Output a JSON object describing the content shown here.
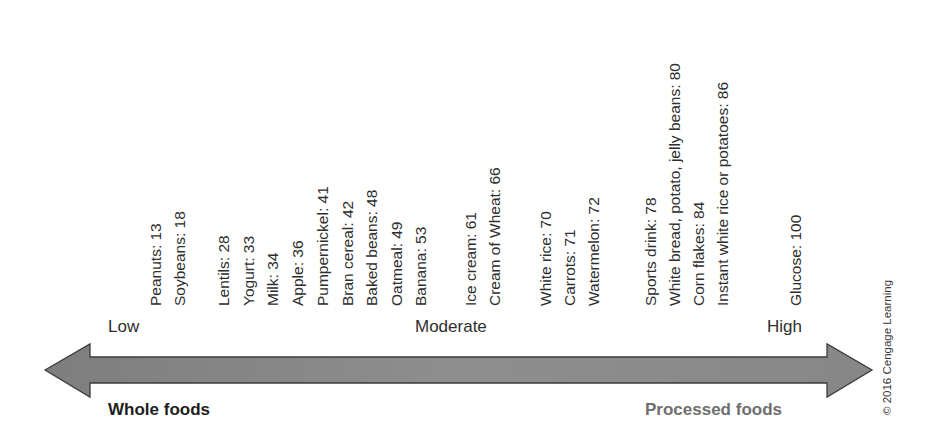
{
  "diagram": {
    "scale": {
      "low_label": "Low",
      "moderate_label": "Moderate",
      "high_label": "High"
    },
    "ends": {
      "left_label": "Whole foods",
      "right_label": "Processed foods"
    },
    "foods": [
      {
        "text": "Peanuts: 13",
        "name": "Peanuts",
        "gi": 13,
        "x": 165
      },
      {
        "text": "Soybeans: 18",
        "name": "Soybeans",
        "gi": 18,
        "x": 189
      },
      {
        "text": "Lentils: 28",
        "name": "Lentils",
        "gi": 28,
        "x": 233
      },
      {
        "text": "Yogurt: 33",
        "name": "Yogurt",
        "gi": 33,
        "x": 258
      },
      {
        "text": "Milk: 34",
        "name": "Milk",
        "gi": 34,
        "x": 282
      },
      {
        "text": "Apple: 36",
        "name": "Apple",
        "gi": 36,
        "x": 307
      },
      {
        "text": "Pumpernickel: 41",
        "name": "Pumpernickel",
        "gi": 41,
        "x": 332
      },
      {
        "text": "Bran cereal: 42",
        "name": "Bran cereal",
        "gi": 42,
        "x": 357
      },
      {
        "text": "Baked beans: 48",
        "name": "Baked beans",
        "gi": 48,
        "x": 381
      },
      {
        "text": "Oatmeal: 49",
        "name": "Oatmeal",
        "gi": 49,
        "x": 406
      },
      {
        "text": "Banana: 53",
        "name": "Banana",
        "gi": 53,
        "x": 430
      },
      {
        "text": "Ice cream: 61",
        "name": "Ice cream",
        "gi": 61,
        "x": 480
      },
      {
        "text": "Cream of Wheat: 66",
        "name": "Cream of Wheat",
        "gi": 66,
        "x": 504
      },
      {
        "text": "White rice: 70",
        "name": "White rice",
        "gi": 70,
        "x": 555
      },
      {
        "text": "Carrots: 71",
        "name": "Carrots",
        "gi": 71,
        "x": 579
      },
      {
        "text": "Watermelon: 72",
        "name": "Watermelon",
        "gi": 72,
        "x": 603
      },
      {
        "text": "Sports drink: 78",
        "name": "Sports drink",
        "gi": 78,
        "x": 660
      },
      {
        "text": "White bread, potato, jelly beans: 80",
        "name": "White bread, potato, jelly beans",
        "gi": 80,
        "x": 684
      },
      {
        "text": "Corn flakes: 84",
        "name": "Corn flakes",
        "gi": 84,
        "x": 708
      },
      {
        "text": "Instant white rice or potatoes: 86",
        "name": "Instant white rice or potatoes",
        "gi": 86,
        "x": 732
      },
      {
        "text": "Glucose: 100",
        "name": "Glucose",
        "gi": 100,
        "x": 805
      }
    ],
    "copyright": "© 2016 Cengage Learning",
    "colors": {
      "arrow_fill": "#8a8a8a",
      "arrow_stroke": "#3c3c3c",
      "whole_foods_text": "#1e1e1e",
      "processed_foods_text": "#6e6e6e"
    }
  }
}
